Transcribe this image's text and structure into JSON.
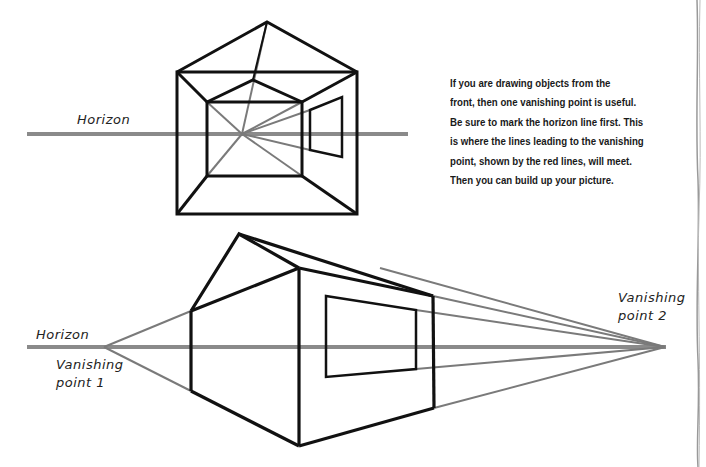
{
  "figure": {
    "top_diagram": {
      "horizon_label": "Horizon",
      "caption_lines": [
        "If you are drawing objects from the",
        "front, then one vanishing point is useful.",
        "Be sure to mark the horizon line first. This",
        "is where the lines leading to the vanishing",
        "point, shown by the red lines, will meet.",
        "Then you can build up your picture."
      ]
    },
    "bottom_diagram": {
      "horizon_label": "Horizon",
      "vp1_label_line1": "Vanishing",
      "vp1_label_line2": "point 1",
      "vp2_label_line1": "Vanishing",
      "vp2_label_line2": "point 2"
    },
    "colors": {
      "outline": "#111111",
      "guide": "#8a8a8a"
    }
  }
}
